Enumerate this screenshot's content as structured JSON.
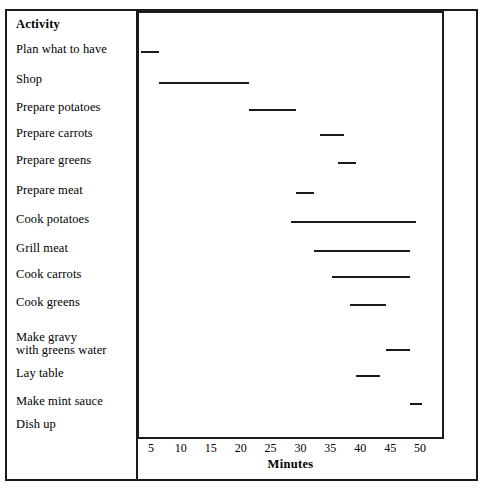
{
  "chart_data": {
    "type": "bar",
    "orientation": "horizontal",
    "subtype": "gantt",
    "title": "",
    "xlabel": "Minutes",
    "ylabel": "Activity",
    "xlim": [
      0,
      52
    ],
    "xticks": [
      5,
      10,
      15,
      20,
      25,
      30,
      35,
      40,
      45,
      50
    ],
    "grid": false,
    "legend": null,
    "categories": [
      "Plan what to have",
      "Shop",
      "Prepare potatoes",
      "Prepare carrots",
      "Prepare greens",
      "Prepare meat",
      "Cook potatoes",
      "Grill meat",
      "Cook carrots",
      "Cook greens",
      "Make gravy\nwith greens water",
      "Lay table",
      "Make mint sauce",
      "Dish up"
    ],
    "tasks": [
      {
        "name": "Plan what to have",
        "start": 3,
        "end": 6,
        "duration": 3,
        "marker": "bar"
      },
      {
        "name": "Shop",
        "start": 6,
        "end": 21,
        "duration": 15,
        "marker": "bar"
      },
      {
        "name": "Prepare potatoes",
        "start": 21,
        "end": 29,
        "duration": 8,
        "marker": "bar"
      },
      {
        "name": "Prepare carrots",
        "start": 33,
        "end": 37,
        "duration": 4,
        "marker": "bar"
      },
      {
        "name": "Prepare greens",
        "start": 36,
        "end": 39,
        "duration": 3,
        "marker": "bar"
      },
      {
        "name": "Prepare meat",
        "start": 29,
        "end": 32,
        "duration": 3,
        "marker": "bar"
      },
      {
        "name": "Cook potatoes",
        "start": 28,
        "end": 49,
        "duration": 21,
        "marker": "bar"
      },
      {
        "name": "Grill meat",
        "start": 32,
        "end": 48,
        "duration": 16,
        "marker": "bar"
      },
      {
        "name": "Cook carrots",
        "start": 35,
        "end": 48,
        "duration": 13,
        "marker": "bar"
      },
      {
        "name": "Cook greens",
        "start": 38,
        "end": 44,
        "duration": 6,
        "marker": "bar"
      },
      {
        "name": "Make gravy with greens water",
        "start": 44,
        "end": 48,
        "duration": 4,
        "marker": "bar"
      },
      {
        "name": "Lay table",
        "start": 39,
        "end": 43,
        "duration": 4,
        "marker": "bar"
      },
      {
        "name": "Make mint sauce",
        "start": 48,
        "end": 50,
        "duration": 2,
        "marker": "bar"
      },
      {
        "name": "Dish up",
        "start": 50,
        "end": 50,
        "duration": 0,
        "marker": "*"
      }
    ]
  },
  "table": {
    "header": "Activity"
  },
  "axis": {
    "xlabel": "Minutes",
    "ticks": [
      "5",
      "10",
      "15",
      "20",
      "25",
      "30",
      "35",
      "40",
      "45",
      "50"
    ]
  },
  "colors": {
    "bar": "#1a1a1a",
    "frame": "#1a1a1a",
    "background": "#ffffff"
  }
}
